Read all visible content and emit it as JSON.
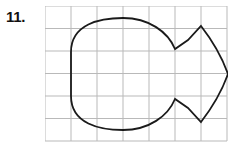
{
  "problem": {
    "number_label": "11."
  },
  "figure": {
    "grid": {
      "columns": 7,
      "rows": 6,
      "cell_width": 26,
      "cell_height": 22.5,
      "origin_x": 45,
      "origin_y": 6,
      "line_color": "#b9b9b9",
      "line_width": 1
    },
    "shape": {
      "name": "fish",
      "stroke_color": "#1a1a1a",
      "stroke_width": 1.8,
      "fill": "none",
      "description": "Closed fish outline: rounded body with a straight left edge, concave notches top and bottom where the tail begins, and a pointed tail tip at the right.",
      "path": "M 26 46 C 26 18 55 12 78 12 C 104 12 123 26 130 43 L 143 34 L 156 20 C 170 38 178 54 183 68 C 178 82 170 98 156 116 L 143 102 L 130 93 C 123 110 104 124 78 124 C 55 124 26 118 26 90 Z",
      "vertices": [
        {
          "name": "left-top",
          "x": 26,
          "y": 46
        },
        {
          "name": "body-top-apex",
          "x": 78,
          "y": 12
        },
        {
          "name": "top-notch",
          "x": 130,
          "y": 43
        },
        {
          "name": "tail-top-tip",
          "x": 156,
          "y": 20
        },
        {
          "name": "tail-point",
          "x": 183,
          "y": 68
        },
        {
          "name": "tail-bottom-tip",
          "x": 156,
          "y": 116
        },
        {
          "name": "bottom-notch",
          "x": 130,
          "y": 93
        },
        {
          "name": "body-bottom-apex",
          "x": 78,
          "y": 124
        },
        {
          "name": "left-bottom",
          "x": 26,
          "y": 90
        }
      ]
    }
  },
  "colors": {
    "background": "#ffffff",
    "grid_line": "#b9b9b9",
    "outline": "#1a1a1a",
    "label_text": "#111111"
  }
}
